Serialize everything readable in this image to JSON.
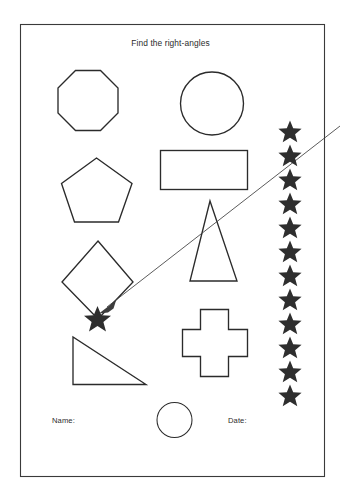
{
  "page": {
    "title": "Find the right-angles",
    "width": 341,
    "height": 499,
    "background_color": "#ffffff",
    "ink_color": "#2b2b2b",
    "border_color": "#3a3a3a"
  },
  "header": {
    "title": "Find the right-angles"
  },
  "footer": {
    "name_label": "Name:",
    "date_label": "Date:"
  },
  "shapes": [
    {
      "id": "octagon",
      "name": "octagon",
      "label": "Octagon",
      "row": 1,
      "column": "left"
    },
    {
      "id": "circle-large",
      "name": "circle",
      "label": "Circle",
      "row": 1,
      "column": "right"
    },
    {
      "id": "pentagon",
      "name": "pentagon",
      "label": "Pentagon",
      "row": 2,
      "column": "left"
    },
    {
      "id": "rectangle",
      "name": "rectangle",
      "label": "Rectangle",
      "row": 2,
      "column": "right"
    },
    {
      "id": "triangle-tall",
      "name": "isosceles-triangle",
      "label": "Tall triangle",
      "row": 3,
      "column": "right"
    },
    {
      "id": "diamond",
      "name": "rhombus",
      "label": "Diamond",
      "row": 3,
      "column": "left"
    },
    {
      "id": "cross",
      "name": "cross",
      "label": "Cross",
      "row": 4,
      "column": "right"
    },
    {
      "id": "triangle-right",
      "name": "right-triangle",
      "label": "Right triangle",
      "row": 4,
      "column": "left"
    },
    {
      "id": "circle-small",
      "name": "circle",
      "label": "Small circle",
      "row": 5,
      "column": "center"
    }
  ],
  "star_column": {
    "icon": "star-icon",
    "count": 12,
    "fill_color": "#2e2e2e"
  },
  "marker": {
    "icon": "star-icon",
    "description": "marked vertex",
    "target_shape": "diamond"
  },
  "pointer": {
    "icon": "arrow-icon",
    "description": "arrow pointing to marked vertex"
  }
}
